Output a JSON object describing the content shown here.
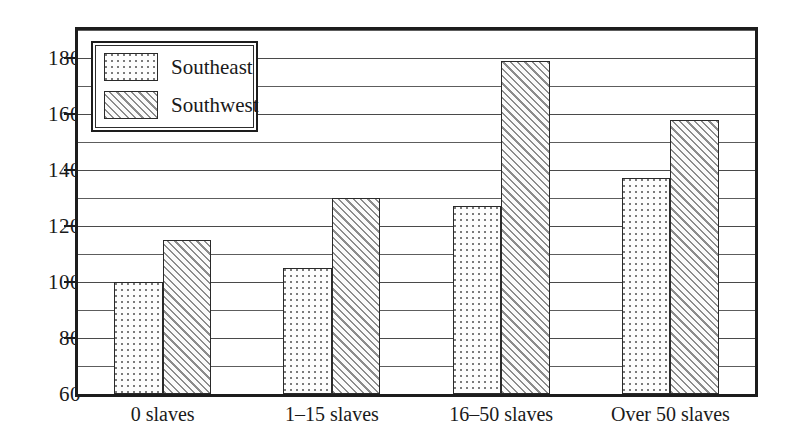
{
  "chart_data": {
    "type": "bar",
    "title": "",
    "subtitle": "",
    "xlabel": "",
    "ylabel": "",
    "categories": [
      "0 slaves",
      "1–15 slaves",
      "16–50 slaves",
      "Over 50 slaves"
    ],
    "series": [
      {
        "name": "Southeast",
        "values": [
          100,
          105,
          127,
          137
        ],
        "pattern": "dotted"
      },
      {
        "name": "Southwest",
        "values": [
          115,
          130,
          179,
          158
        ],
        "pattern": "diagonal-hatch"
      }
    ],
    "ylim": [
      60,
      190
    ],
    "ytick_labels": [
      "60",
      "80",
      "100",
      "120",
      "140",
      "160",
      "180"
    ],
    "ytick_values": [
      60,
      80,
      100,
      120,
      140,
      160,
      180
    ],
    "minor_gridline_values": [
      70,
      90,
      110,
      130,
      150,
      170,
      190
    ],
    "grid": true,
    "grid_axis": "y",
    "legend_position": "top-left",
    "legend_entries": [
      "Southeast",
      "Southwest"
    ],
    "annotations": [],
    "colors": {
      "axis": "#1d1d1d",
      "gridline": "#4a4a4a",
      "bar_outline": "#2a2a2a",
      "southeast_fill": "#fdfdfd",
      "southwest_fill": "#f2f2f2",
      "background": "#ffffff"
    }
  }
}
